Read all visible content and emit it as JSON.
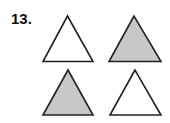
{
  "problem": {
    "number_label": "13."
  },
  "colors": {
    "outline": "#222222",
    "shaded_fill": "#c8c8c8",
    "unshaded_fill": "#ffffff"
  },
  "triangles": [
    {
      "position": "top-left",
      "shaded": false,
      "points": "67.5,16 43,61.5 93,61.5"
    },
    {
      "position": "top-right",
      "shaded": true,
      "points": "134,16 109,61.5 161,61.5"
    },
    {
      "position": "bottom-left",
      "shaded": true,
      "points": "68,70 43,115 93,115"
    },
    {
      "position": "bottom-right",
      "shaded": false,
      "points": "135,70 110,115 161,115"
    }
  ]
}
